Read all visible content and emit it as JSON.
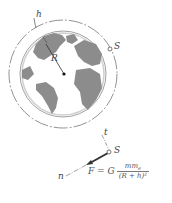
{
  "figure": {
    "type": "physics-diagram",
    "labels": {
      "altitude": "h",
      "radius": "R",
      "satellite_top": "S",
      "satellite_bottom": "S",
      "tangential": "t",
      "normal": "n"
    },
    "formula": {
      "lhs": "F = G",
      "numerator": "mm",
      "numerator_sub": "e",
      "denominator": "(R + h)²"
    },
    "colors": {
      "land": "#8c8c8c",
      "ocean": "#ffffff",
      "lines": "#555555",
      "force_arrow": "#333333"
    }
  }
}
